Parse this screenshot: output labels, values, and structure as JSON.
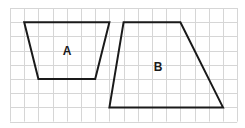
{
  "diagram": {
    "type": "grid-trapezoids",
    "grid": {
      "columns": 16,
      "rows": 8,
      "cell_px": 14.2,
      "line_color": "#d6d6d6"
    },
    "shapes": [
      {
        "label": "A",
        "kind": "trapezoid",
        "vertices_grid": [
          [
            1,
            1
          ],
          [
            7,
            1
          ],
          [
            6,
            5
          ],
          [
            2,
            5
          ]
        ]
      },
      {
        "label": "B",
        "kind": "trapezoid",
        "vertices_grid": [
          [
            8,
            1
          ],
          [
            12,
            1
          ],
          [
            15,
            7
          ],
          [
            7,
            7
          ]
        ]
      }
    ],
    "stroke_color": "#1a1a1a"
  }
}
